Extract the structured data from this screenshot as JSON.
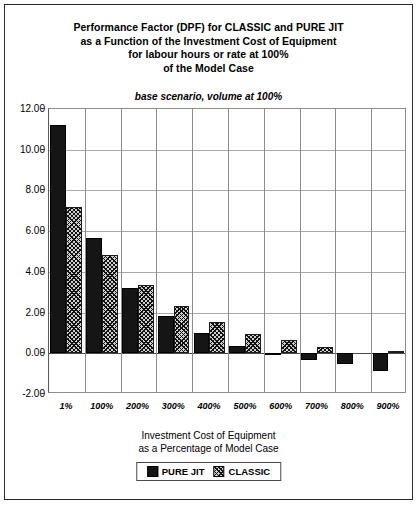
{
  "title": {
    "lines": [
      "Performance Factor (DPF) for CLASSIC and PURE JIT",
      "as a Function of the Investment Cost of Equipment",
      "for labour hours or rate at 100%",
      "of the Model Case"
    ],
    "subtitle": "base scenario, volume at 100%"
  },
  "xaxis_title": {
    "line1": "Investment Cost of Equipment",
    "line2": "as a Percentage of Model Case"
  },
  "legend": {
    "items": [
      {
        "label": "PURE JIT",
        "color": "#151515",
        "pattern": "solid"
      },
      {
        "label": "CLASSIC",
        "color": "#cfcfcf",
        "pattern": "crosshatch"
      }
    ]
  },
  "chart_data": {
    "type": "bar",
    "title": "Performance Factor (DPF) for CLASSIC and PURE JIT as a Function of the Investment Cost of Equipment for labour hours or rate at 100% of the Model Case",
    "subtitle": "base scenario, volume at 100%",
    "xlabel": "Investment Cost of Equipment as a Percentage of Model Case",
    "ylabel": "",
    "categories": [
      "1%",
      "100%",
      "200%",
      "300%",
      "400%",
      "500%",
      "600%",
      "700%",
      "800%",
      "900%"
    ],
    "series": [
      {
        "name": "PURE JIT",
        "values": [
          11.2,
          5.65,
          3.2,
          1.85,
          1.0,
          0.35,
          -0.05,
          -0.35,
          -0.55,
          -0.85
        ]
      },
      {
        "name": "CLASSIC",
        "values": [
          7.2,
          4.85,
          3.35,
          2.3,
          1.55,
          0.95,
          0.65,
          0.3,
          0.0,
          0.1
        ]
      }
    ],
    "ylim": [
      -2.0,
      12.0
    ],
    "ytick_labels": [
      "12.00",
      "10.00",
      "8.00",
      "6.00",
      "4.00",
      "2.00",
      "0.00",
      "-2.00"
    ],
    "ytick_values": [
      12.0,
      10.0,
      8.0,
      6.0,
      4.0,
      2.0,
      0.0,
      -2.0
    ],
    "grid": true,
    "legend_position": "bottom"
  }
}
